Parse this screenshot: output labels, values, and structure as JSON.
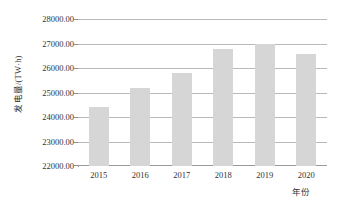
{
  "chart_data": {
    "type": "bar",
    "title": "",
    "xlabel": "年份",
    "ylabel": "发电量/(TW·h)",
    "categories": [
      "2015",
      "2016",
      "2017",
      "2018",
      "2019",
      "2020"
    ],
    "values": [
      24430,
      25200,
      25830,
      26820,
      27020,
      26600
    ],
    "ylim": [
      22000,
      28000
    ],
    "ytick_labels": [
      "28000.00",
      "27000.00",
      "26000.00",
      "25000.00",
      "24000.00",
      "23000.00",
      "22000.00"
    ],
    "ytick_values": [
      28000,
      27000,
      26000,
      25000,
      24000,
      23000,
      22000
    ],
    "grid": true,
    "legend": "none",
    "bar_color": "#d6d6d6",
    "grid_color": "#b9b9b9",
    "axis_color": "#8f8f8f",
    "background": "#ffffff"
  }
}
